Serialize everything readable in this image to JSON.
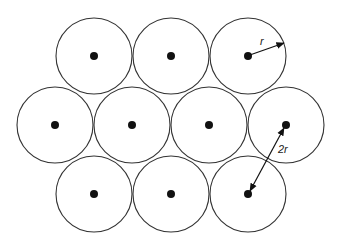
{
  "diagram": {
    "rows": [
      {
        "name": "top",
        "count": 3
      },
      {
        "name": "middle",
        "count": 4
      },
      {
        "name": "bottom",
        "count": 3
      }
    ],
    "radius_label": "r",
    "distance_label": "2r",
    "colors": {
      "stroke": "#333333",
      "center": "#111111",
      "background": "#ffffff"
    }
  }
}
